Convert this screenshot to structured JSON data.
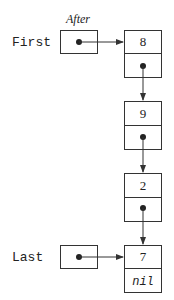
{
  "diagram": {
    "caption": "After",
    "pointers": [
      {
        "label": "First",
        "points_to": 0
      },
      {
        "label": "Last",
        "points_to": 3
      }
    ],
    "nodes": [
      {
        "value": "8",
        "next": "pointer"
      },
      {
        "value": "9",
        "next": "pointer"
      },
      {
        "value": "2",
        "next": "pointer"
      },
      {
        "value": "7",
        "next": "nil"
      }
    ]
  }
}
